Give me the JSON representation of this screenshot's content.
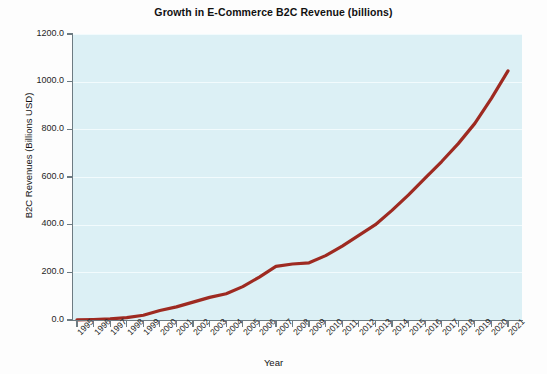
{
  "chart_data": {
    "type": "line",
    "title": "Growth in E-Commerce B2C Revenue (billions)",
    "xlabel": "Year",
    "ylabel": "B2C Revenues (Billions USD)",
    "categories": [
      "1995",
      "1996",
      "1997",
      "1998",
      "1999",
      "2000",
      "2001",
      "2002",
      "2003",
      "2004",
      "2005",
      "2006",
      "2007",
      "2008",
      "2009",
      "2010",
      "2011",
      "2012",
      "2013",
      "2014",
      "2015",
      "2016",
      "2017",
      "2018",
      "2019",
      "2020",
      "2021"
    ],
    "x": [
      1995,
      1996,
      1997,
      1998,
      1999,
      2000,
      2001,
      2002,
      2003,
      2004,
      2005,
      2006,
      2007,
      2008,
      2009,
      2010,
      2011,
      2012,
      2013,
      2014,
      2015,
      2016,
      2017,
      2018,
      2019,
      2020,
      2021
    ],
    "values": [
      0.5,
      2,
      5,
      10,
      20,
      40,
      55,
      75,
      95,
      110,
      140,
      180,
      225,
      235,
      240,
      270,
      310,
      355,
      400,
      460,
      525,
      595,
      665,
      740,
      825,
      930,
      1045
    ],
    "ylim": [
      0,
      1200
    ],
    "ytick_values": [
      0.0,
      200.0,
      400.0,
      600.0,
      800.0,
      1000.0,
      1200.0
    ],
    "ytick_labels": [
      "0.0",
      "200.0",
      "400.0",
      "600.0",
      "800.0",
      "1000.0",
      "1200.0"
    ],
    "grid": true,
    "legend": false,
    "series": [
      {
        "name": "B2C Revenue",
        "color": "#9e2a21",
        "values": [
          0.5,
          2,
          5,
          10,
          20,
          40,
          55,
          75,
          95,
          110,
          140,
          180,
          225,
          235,
          240,
          270,
          310,
          355,
          400,
          460,
          525,
          595,
          665,
          740,
          825,
          930,
          1045
        ]
      }
    ],
    "plot_background": "#dcf0f5",
    "gridline_color": "#f2fbfd",
    "axis_color": "#6d7b82"
  }
}
